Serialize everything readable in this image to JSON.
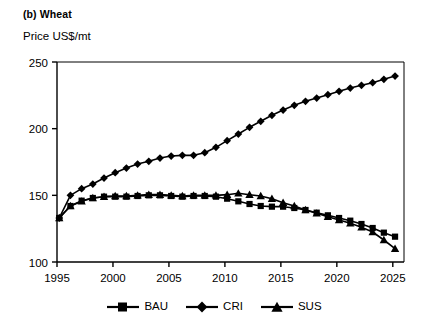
{
  "figure": {
    "panel_label": "(b) Wheat",
    "y_axis_title": "Price US$/mt"
  },
  "legend": {
    "position": "bottom-center",
    "entries": [
      {
        "label": "BAU",
        "marker": "square-marker-icon"
      },
      {
        "label": "CRI",
        "marker": "diamond-marker-icon"
      },
      {
        "label": "SUS",
        "marker": "triangle-marker-icon"
      }
    ]
  },
  "axes": {
    "y_ticks": [
      "100",
      "150",
      "200",
      "250"
    ],
    "x_ticks": [
      "1995",
      "2000",
      "2005",
      "2010",
      "2015",
      "2020",
      "2025"
    ]
  },
  "colors": {
    "line": "#000000",
    "axis": "#000000",
    "background": "#ffffff"
  },
  "chart_data": {
    "type": "line",
    "title": "(b) Wheat",
    "xlabel": "",
    "ylabel": "Price US$/mt",
    "xlim": [
      1995,
      2026
    ],
    "ylim": [
      100,
      250
    ],
    "ytick_values": [
      100,
      150,
      200,
      250
    ],
    "xtick_values": [
      1995,
      2000,
      2005,
      2010,
      2015,
      2020,
      2025
    ],
    "grid": false,
    "legend_position": "bottom-center",
    "x": [
      1995.2,
      1996.2,
      1997.2,
      1998.2,
      1999.2,
      2000.2,
      2001.2,
      2002.2,
      2003.2,
      2004.2,
      2005.2,
      2006.2,
      2007.2,
      2008.2,
      2009.2,
      2010.2,
      2011.2,
      2012.2,
      2013.2,
      2014.2,
      2015.2,
      2016.2,
      2017.2,
      2018.2,
      2019.2,
      2020.2,
      2021.2,
      2022.2,
      2023.2,
      2024.2,
      2025.2
    ],
    "series": [
      {
        "name": "BAU",
        "marker": "square",
        "values": [
          133,
          142,
          146,
          148,
          149,
          149,
          149,
          149.5,
          150,
          150,
          149.5,
          149,
          149.5,
          149.5,
          149,
          147.5,
          145.5,
          143.5,
          142,
          141.5,
          141.5,
          140.5,
          139,
          137,
          135,
          133,
          131,
          128.5,
          125.5,
          122,
          119
        ]
      },
      {
        "name": "CRI",
        "marker": "diamond",
        "values": [
          133,
          150,
          155,
          158.5,
          163,
          167,
          170.5,
          173.5,
          175.5,
          178,
          179.5,
          180,
          180,
          182,
          186,
          191,
          196,
          201,
          205.5,
          210,
          214,
          217.5,
          220.5,
          223,
          225.5,
          228,
          230.5,
          232.5,
          234.5,
          237,
          239.5
        ]
      },
      {
        "name": "SUS",
        "marker": "triangle",
        "values": [
          133,
          142,
          145.5,
          148,
          149,
          149.5,
          149.5,
          150,
          150.5,
          150.5,
          150,
          149.5,
          150,
          150,
          150,
          150.5,
          151.5,
          150.5,
          149.5,
          147.5,
          144.5,
          142,
          139,
          136.5,
          134,
          131.5,
          129,
          126,
          122.5,
          116.5,
          110
        ]
      }
    ]
  }
}
